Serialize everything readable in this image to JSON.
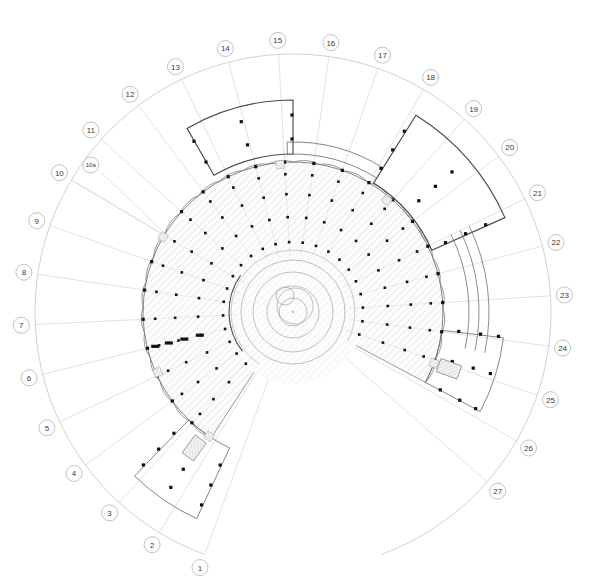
{
  "drawing": {
    "type": "architectural-floor-plan",
    "description": "Radial fan-shaped building floor plan with numbered structural grid",
    "canvas": {
      "width": 594,
      "height": 580
    },
    "center": {
      "x": 293,
      "y": 312
    },
    "background_color": "#ffffff"
  },
  "colors": {
    "grid_line": "#c9c9c9",
    "grid_line_light": "#d8d8d8",
    "outer_arc": "#bdbdbd",
    "bubble_stroke": "#9a9a9a",
    "bubble_fill": "#ffffff",
    "label_text": "#3a3a3a",
    "wall_heavy": "#4a4a4a",
    "wall_medium": "#707070",
    "wall_light": "#a8a8a8",
    "hatch": "#cfcfcf",
    "hatch_fill": "#fdfdfd",
    "column": "#111111",
    "core_line": "#9c9c9c"
  },
  "geometry": {
    "grid_inner_radius": 28,
    "grid_outer_radius": 258,
    "label_ring_radius": 272,
    "building_outer_radius": 150,
    "building_inner_radius": 62,
    "core_radius": 40,
    "scallop_count": 27,
    "fan_start_angle_deg": 200,
    "fan_end_angle_deg": 520
  },
  "grid": {
    "axis_prefix": "",
    "labels": [
      {
        "id": "1",
        "text": "1",
        "angle_deg": 200.0,
        "size": "normal"
      },
      {
        "id": "2",
        "text": "2",
        "angle_deg": 211.2,
        "size": "normal"
      },
      {
        "id": "3",
        "text": "3",
        "angle_deg": 222.4,
        "size": "normal"
      },
      {
        "id": "4",
        "text": "4",
        "angle_deg": 233.6,
        "size": "normal"
      },
      {
        "id": "5",
        "text": "5",
        "angle_deg": 244.8,
        "size": "normal"
      },
      {
        "id": "6",
        "text": "6",
        "angle_deg": 256.0,
        "size": "normal"
      },
      {
        "id": "7",
        "text": "7",
        "angle_deg": 267.2,
        "size": "normal"
      },
      {
        "id": "8",
        "text": "8",
        "angle_deg": 278.4,
        "size": "normal"
      },
      {
        "id": "9",
        "text": "9",
        "angle_deg": 289.6,
        "size": "normal"
      },
      {
        "id": "10",
        "text": "10",
        "angle_deg": 300.8,
        "size": "normal"
      },
      {
        "id": "10a",
        "text": "10a",
        "angle_deg": 306.0,
        "size": "small",
        "radius_offset": 22
      },
      {
        "id": "11",
        "text": "11",
        "angle_deg": 312.0,
        "size": "normal"
      },
      {
        "id": "12",
        "text": "12",
        "angle_deg": 323.2,
        "size": "normal"
      },
      {
        "id": "13",
        "text": "13",
        "angle_deg": 334.4,
        "size": "normal"
      },
      {
        "id": "14",
        "text": "14",
        "angle_deg": 345.6,
        "size": "normal"
      },
      {
        "id": "15",
        "text": "15",
        "angle_deg": 356.8,
        "size": "normal"
      },
      {
        "id": "16",
        "text": "16",
        "angle_deg": 368.0,
        "size": "normal"
      },
      {
        "id": "17",
        "text": "17",
        "angle_deg": 379.2,
        "size": "normal"
      },
      {
        "id": "18",
        "text": "18",
        "angle_deg": 390.4,
        "size": "normal"
      },
      {
        "id": "19",
        "text": "19",
        "angle_deg": 401.6,
        "size": "normal"
      },
      {
        "id": "20",
        "text": "20",
        "angle_deg": 412.8,
        "size": "normal"
      },
      {
        "id": "21",
        "text": "21",
        "angle_deg": 424.0,
        "size": "normal"
      },
      {
        "id": "22",
        "text": "22",
        "angle_deg": 435.2,
        "size": "normal"
      },
      {
        "id": "23",
        "text": "23",
        "angle_deg": 446.4,
        "size": "normal"
      },
      {
        "id": "24",
        "text": "24",
        "angle_deg": 457.6,
        "size": "normal"
      },
      {
        "id": "25",
        "text": "25",
        "angle_deg": 468.8,
        "size": "normal"
      },
      {
        "id": "26",
        "text": "26",
        "angle_deg": 480.0,
        "size": "normal"
      },
      {
        "id": "27",
        "text": "27",
        "angle_deg": 491.2,
        "size": "normal"
      }
    ]
  },
  "building": {
    "footprint_start_angle_deg": 213,
    "footprint_end_angle_deg": 478,
    "ring_radii": [
      62,
      88,
      112,
      132,
      150
    ],
    "column_rings": [
      70,
      95,
      118,
      138,
      150
    ],
    "annular_arcs": [
      {
        "radius": 150,
        "from_deg": 213,
        "to_deg": 478,
        "weight": "medium"
      },
      {
        "radius": 62,
        "from_deg": 213,
        "to_deg": 478,
        "weight": "light"
      }
    ]
  },
  "wings": {
    "top": {
      "name": "north-canopy",
      "inner_radius": 158,
      "outer_radius": 212,
      "start_angle_deg": 330,
      "end_angle_deg": 360,
      "weight": "heavy"
    },
    "upper_right": {
      "name": "northeast-band",
      "inner_radius": 158,
      "outer_radius": 170,
      "start_angle_deg": 358,
      "end_angle_deg": 392,
      "weight": "medium"
    },
    "right": {
      "name": "east-pavilion",
      "inner_radius": 152,
      "outer_radius": 232,
      "start_angle_deg": 392,
      "end_angle_deg": 426,
      "weight": "heavy"
    },
    "right_curves": {
      "name": "east-curved-walls",
      "radii": [
        176,
        186,
        196
      ],
      "start_angle_deg": 424,
      "end_angle_deg": 462
    },
    "lower_right": {
      "name": "southeast-wing",
      "inner_radius": 150,
      "outer_radius": 212,
      "start_angle_deg": 457,
      "end_angle_deg": 478,
      "weight": "medium"
    },
    "lower_left": {
      "name": "southwest-wing",
      "inner_radius": 150,
      "outer_radius": 228,
      "start_angle_deg": 205,
      "end_angle_deg": 224,
      "weight": "medium"
    }
  },
  "core": {
    "name": "central-core",
    "rings": [
      14,
      26,
      40,
      52
    ],
    "stair_marker": {
      "cx_offset": -8,
      "cy_offset": -16,
      "r": 9
    },
    "spiral_marker": {
      "cx_offset": 2,
      "cy_offset": -6,
      "r": 18
    }
  },
  "legend": {
    "columns_note": "",
    "scale_note": "",
    "title_note": ""
  }
}
